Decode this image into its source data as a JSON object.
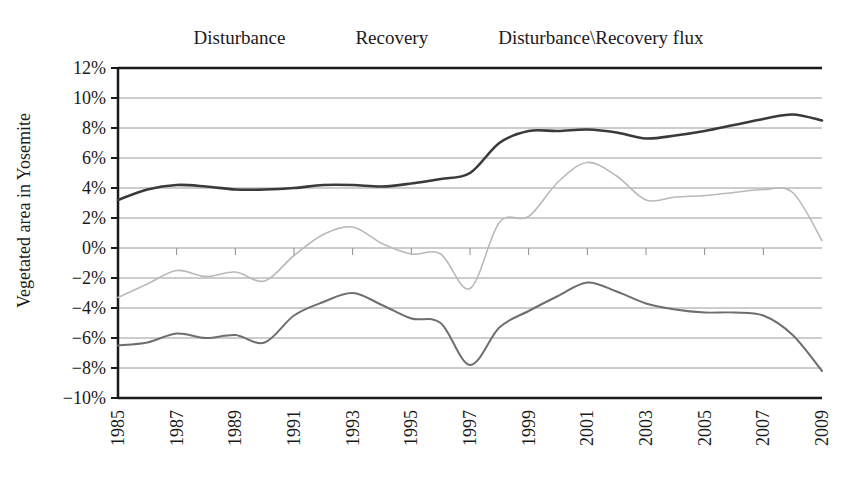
{
  "chart_data": {
    "type": "line",
    "title": "",
    "xlabel": "",
    "ylabel": "Vegetated area in Yosemite",
    "xlim": [
      1985,
      2009
    ],
    "ylim": [
      -0.1,
      0.12
    ],
    "y_tick_step": 0.02,
    "grid": true,
    "legend_position": "top-center",
    "x_tick_labels": [
      "1985",
      "1987",
      "1989",
      "1991",
      "1993",
      "1995",
      "1997",
      "1999",
      "2001",
      "2003",
      "2005",
      "2007",
      "2009"
    ],
    "y_tick_labels": [
      "12%",
      "10%",
      "8%",
      "6%",
      "4%",
      "2%",
      "0%",
      "-2%",
      "-4%",
      "-6%",
      "-8%",
      "-10%"
    ],
    "x": [
      1985,
      1986,
      1987,
      1988,
      1989,
      1990,
      1991,
      1992,
      1993,
      1994,
      1995,
      1996,
      1997,
      1998,
      1999,
      2000,
      2001,
      2002,
      2003,
      2004,
      2005,
      2006,
      2007,
      2008,
      2009
    ],
    "series": [
      {
        "name": "Disturbance",
        "color": "#6e6e6e",
        "values": [
          -6.5,
          -6.3,
          -5.7,
          -6.0,
          -5.8,
          -6.3,
          -4.5,
          -3.6,
          -3.0,
          -3.8,
          -4.7,
          -5.0,
          -7.8,
          -5.3,
          -4.2,
          -3.2,
          -2.3,
          -2.9,
          -3.7,
          -4.1,
          -4.3,
          -4.3,
          -4.5,
          -5.8,
          -8.2
        ]
      },
      {
        "name": "Recovery",
        "color": "#3a3a3a",
        "values": [
          3.2,
          3.9,
          4.2,
          4.1,
          3.9,
          3.9,
          4.0,
          4.2,
          4.2,
          4.1,
          4.3,
          4.6,
          5.0,
          7.0,
          7.8,
          7.8,
          7.9,
          7.7,
          7.3,
          7.5,
          7.8,
          8.2,
          8.6,
          8.9,
          8.5
        ]
      },
      {
        "name": "Disturbance\\Recovery flux",
        "color": "#b9b9b9",
        "values": [
          -3.3,
          -2.4,
          -1.5,
          -1.9,
          -1.6,
          -2.2,
          -0.5,
          0.9,
          1.4,
          0.3,
          -0.4,
          -0.4,
          -2.7,
          1.7,
          2.1,
          4.4,
          5.7,
          4.8,
          3.2,
          3.4,
          3.5,
          3.7,
          3.9,
          3.7,
          0.5
        ]
      }
    ]
  },
  "legend": {
    "entries": [
      {
        "label": "Disturbance",
        "color": "#6e6e6e"
      },
      {
        "label": "Recovery",
        "color": "#3a3a3a"
      },
      {
        "label": "Disturbance\\Recovery flux",
        "color": "#c2c2c2"
      }
    ]
  },
  "axes": {
    "y_title": "Vegetated area in Yosemite"
  }
}
